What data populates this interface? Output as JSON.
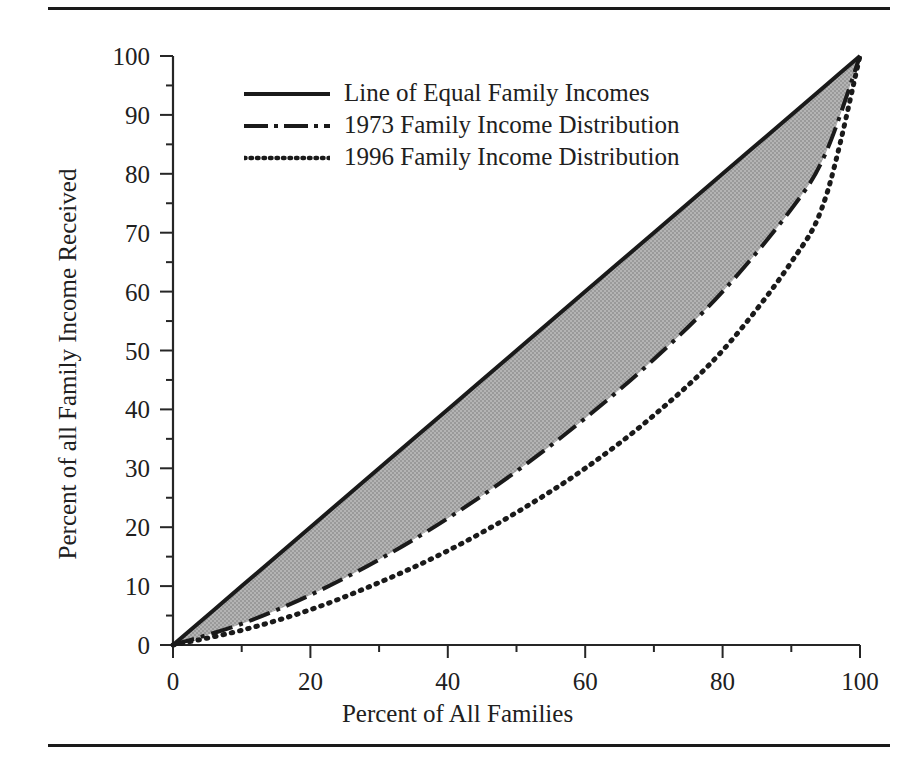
{
  "figure": {
    "top_rule": "horizontal-rule",
    "bottom_rule": "horizontal-rule"
  },
  "chart_data": {
    "type": "line",
    "title": "",
    "xlabel": "Percent of All Families",
    "ylabel": "Percent of all Family Income Received",
    "xlim": [
      0,
      100
    ],
    "ylim": [
      0,
      100
    ],
    "xticks": [
      0,
      20,
      40,
      60,
      80,
      100
    ],
    "yticks": [
      0,
      10,
      20,
      30,
      40,
      50,
      60,
      70,
      80,
      90,
      100
    ],
    "xminorticks": [
      10,
      30,
      50,
      70,
      90
    ],
    "yminorticks": [
      5,
      15,
      25,
      35,
      45,
      55,
      65,
      75,
      85,
      95
    ],
    "grid": false,
    "legend_position": "upper left inside",
    "shaded_region": {
      "label": "area between line of equality and 1973 distribution",
      "color": "#a9a9a9",
      "between": [
        "Line of Equal Family Incomes",
        "1973 Family Income Distribution"
      ]
    },
    "x": [
      0,
      10,
      20,
      30,
      40,
      50,
      60,
      70,
      80,
      90,
      95,
      100
    ],
    "series": [
      {
        "name": "Line of Equal Family Incomes",
        "style": "solid",
        "color": "#1a1a1a",
        "values": [
          0,
          10,
          20,
          30,
          40,
          50,
          60,
          70,
          80,
          90,
          95,
          100
        ]
      },
      {
        "name": "1973 Family Income Distribution",
        "style": "dash-dot",
        "color": "#1a1a1a",
        "values": [
          0,
          3.6,
          8.5,
          14.5,
          21.5,
          29.5,
          38.5,
          48.5,
          60.0,
          74.0,
          83.5,
          100
        ]
      },
      {
        "name": "1996 Family Income Distribution",
        "style": "dotted",
        "color": "#1a1a1a",
        "values": [
          0,
          2.5,
          6.0,
          10.6,
          16.0,
          22.5,
          30.0,
          39.0,
          50.0,
          65.0,
          76.0,
          100
        ]
      }
    ],
    "legend": [
      {
        "label": "Line of Equal Family Incomes",
        "style": "solid"
      },
      {
        "label": "1973 Family Income Distribution",
        "style": "dash-dot"
      },
      {
        "label": "1996 Family Income Distribution",
        "style": "dotted"
      }
    ]
  }
}
